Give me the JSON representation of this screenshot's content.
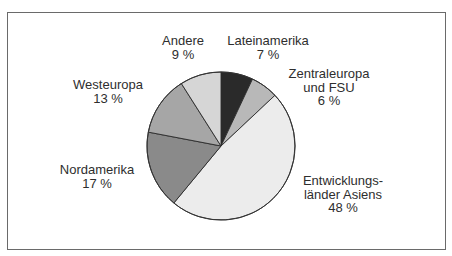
{
  "chart_data": {
    "type": "pie",
    "title": "",
    "start_angle_deg": 0,
    "direction": "clockwise",
    "center": [
      221,
      146
    ],
    "radius": 74,
    "slices": [
      {
        "label": "Lateinamerika",
        "value": 7,
        "value_label": "7 %",
        "color": "#2a2a2a"
      },
      {
        "label": "Zentraleuropa und FSU",
        "value": 6,
        "value_label": "6 %",
        "color": "#b8b8b8"
      },
      {
        "label": "Entwicklungsländer Asiens",
        "value": 48,
        "value_label": "48 %",
        "color": "#ececec"
      },
      {
        "label": "Nordamerika",
        "value": 17,
        "value_label": "17 %",
        "color": "#8a8a8a"
      },
      {
        "label": "Westeuropa",
        "value": 13,
        "value_label": "13 %",
        "color": "#a6a6a6"
      },
      {
        "label": "Andere",
        "value": 9,
        "value_label": "9 %",
        "color": "#d6d6d6"
      }
    ],
    "unit": "%"
  },
  "labels": {
    "lateinamerika": {
      "line1": "Lateinamerika",
      "line2": "7 %"
    },
    "zentraleuropa": {
      "line1": "Zentraleuropa",
      "line2": "und FSU",
      "line3": "6 %"
    },
    "asien": {
      "line1": "Entwicklungs-",
      "line2": "länder Asiens",
      "line3": "48 %"
    },
    "nordamerika": {
      "line1": "Nordamerika",
      "line2": "17 %"
    },
    "westeuropa": {
      "line1": "Westeuropa",
      "line2": "13 %"
    },
    "andere": {
      "line1": "Andere",
      "line2": "9 %"
    }
  }
}
